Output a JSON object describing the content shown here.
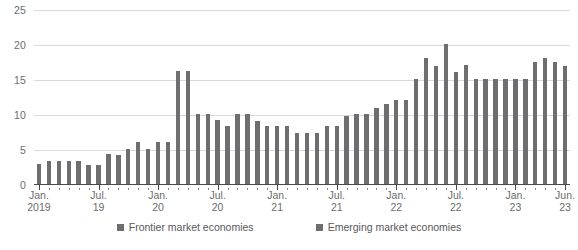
{
  "chart_data": {
    "type": "bar",
    "title": "",
    "subtitle": "",
    "xlabel": "",
    "ylabel": "",
    "ylim": [
      0,
      25
    ],
    "yticks": [
      0,
      5,
      10,
      15,
      20,
      25
    ],
    "grid": true,
    "legend_position": "bottom",
    "x_tick_labels": [
      {
        "line1": "Jan.",
        "line2": "2019",
        "index": 0
      },
      {
        "line1": "Jul.",
        "line2": "19",
        "index": 6
      },
      {
        "line1": "Jan.",
        "line2": "20",
        "index": 12
      },
      {
        "line1": "Jul.",
        "line2": "20",
        "index": 18
      },
      {
        "line1": "Jan.",
        "line2": "21",
        "index": 24
      },
      {
        "line1": "Jul.",
        "line2": "21",
        "index": 30
      },
      {
        "line1": "Jan.",
        "line2": "22",
        "index": 36
      },
      {
        "line1": "Jul.",
        "line2": "22",
        "index": 42
      },
      {
        "line1": "Jan.",
        "line2": "23",
        "index": 48
      },
      {
        "line1": "Jun.",
        "line2": "23",
        "index": 53
      }
    ],
    "categories": [
      "Jan. 2019",
      "Feb. 2019",
      "Mar. 2019",
      "Apr. 2019",
      "May 2019",
      "Jun. 2019",
      "Jul. 2019",
      "Aug. 2019",
      "Sep. 2019",
      "Oct. 2019",
      "Nov. 2019",
      "Dec. 2019",
      "Jan. 2020",
      "Feb. 2020",
      "Mar. 2020",
      "Apr. 2020",
      "May 2020",
      "Jun. 2020",
      "Jul. 2020",
      "Aug. 2020",
      "Sep. 2020",
      "Oct. 2020",
      "Nov. 2020",
      "Dec. 2020",
      "Jan. 2021",
      "Feb. 2021",
      "Mar. 2021",
      "Apr. 2021",
      "May 2021",
      "Jun. 2021",
      "Jul. 2021",
      "Aug. 2021",
      "Sep. 2021",
      "Oct. 2021",
      "Nov. 2021",
      "Dec. 2021",
      "Jan. 2022",
      "Feb. 2022",
      "Mar. 2022",
      "Apr. 2022",
      "May 2022",
      "Jun. 2022",
      "Jul. 2022",
      "Aug. 2022",
      "Sep. 2022",
      "Oct. 2022",
      "Nov. 2022",
      "Dec. 2022",
      "Jan. 2023",
      "Feb. 2023",
      "Mar. 2023",
      "Apr. 2023",
      "May 2023",
      "Jun. 2023"
    ],
    "values": [
      3.0,
      3.5,
      3.5,
      3.5,
      3.5,
      2.9,
      2.9,
      4.4,
      4.3,
      5.2,
      6.2,
      5.2,
      6.2,
      6.2,
      16.3,
      16.3,
      10.2,
      10.2,
      9.3,
      8.4,
      10.2,
      10.2,
      9.2,
      8.4,
      8.4,
      8.4,
      7.5,
      7.5,
      7.5,
      8.4,
      8.4,
      9.9,
      10.2,
      10.2,
      11.0,
      11.6,
      12.1,
      12.1,
      15.2,
      18.2,
      17.0,
      20.1,
      16.1,
      17.2,
      15.2,
      15.2,
      15.2,
      15.2,
      15.2,
      15.2,
      17.6,
      18.2,
      17.6,
      17.0
    ],
    "series": [
      {
        "name": "Frontier market economies",
        "color": "#6e6e70"
      },
      {
        "name": "Emerging market economies",
        "color": "#6e6e70"
      }
    ],
    "legend": [
      {
        "label": "Frontier market economies",
        "color": "#6e6e70",
        "icon": "square-swatch"
      },
      {
        "label": "Emerging market economies",
        "color": "#6e6e70",
        "icon": "square-swatch"
      }
    ],
    "colors": {
      "bar": "#6e6e70",
      "grid": "#d9d9d9",
      "axis": "#4a4a4a",
      "text": "#6c6c6e"
    }
  }
}
